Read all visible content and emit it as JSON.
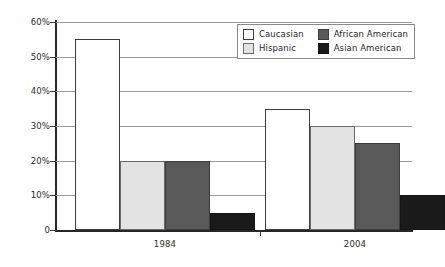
{
  "chart_data": {
    "type": "bar",
    "title": "",
    "xlabel": "",
    "ylabel": "",
    "ylim": [
      0,
      60
    ],
    "grid": true,
    "legend_position": "top-right",
    "categories": [
      "1984",
      "2004"
    ],
    "y_ticks": [
      {
        "value": 60,
        "label": "60%"
      },
      {
        "value": 50,
        "label": "50%"
      },
      {
        "value": 40,
        "label": "40%"
      },
      {
        "value": 30,
        "label": "30%"
      },
      {
        "value": 20,
        "label": "20%"
      },
      {
        "value": 10,
        "label": "10%"
      },
      {
        "value": 0,
        "label": "0"
      }
    ],
    "series": [
      {
        "name": "Caucasian",
        "key": "caucasian",
        "color": "#ffffff",
        "border": "#3d3d3d",
        "values": [
          55,
          35
        ]
      },
      {
        "name": "Hispanic",
        "key": "hispanic",
        "color": "#e3e3e3",
        "border": "#6b6b6b",
        "values": [
          20,
          30
        ]
      },
      {
        "name": "African American",
        "key": "african",
        "color": "#595959",
        "border": "#3d3d3d",
        "values": [
          20,
          25
        ]
      },
      {
        "name": "Asian American",
        "key": "asian",
        "color": "#1a1a1a",
        "border": "#141414",
        "values": [
          5,
          10
        ]
      }
    ]
  },
  "legend": {
    "entries": [
      {
        "label": "Caucasian",
        "key": "caucasian"
      },
      {
        "label": "African American",
        "key": "african"
      },
      {
        "label": "Hispanic",
        "key": "hispanic"
      },
      {
        "label": "Asian American",
        "key": "asian"
      }
    ]
  },
  "axis": {
    "y_labels": [
      "60%",
      "50%",
      "40%",
      "30%",
      "20%",
      "10%",
      "0"
    ],
    "x_labels": [
      "1984",
      "2004"
    ]
  }
}
